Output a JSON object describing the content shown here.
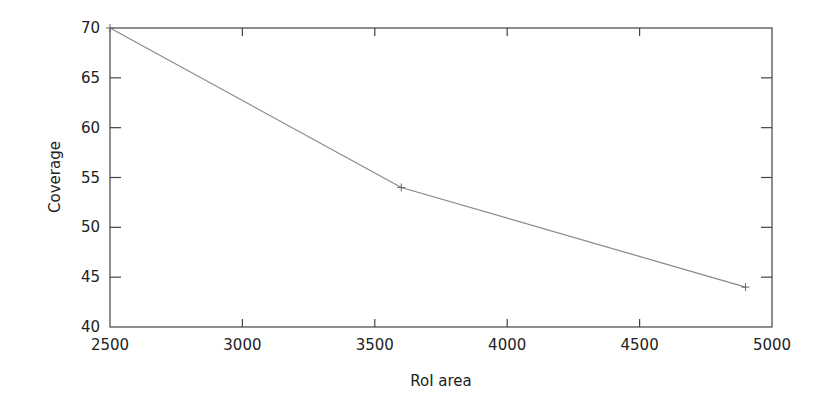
{
  "chart_data": {
    "type": "line",
    "title": "",
    "xlabel": "RoI area",
    "ylabel": "Coverage",
    "xlim": [
      2500,
      5000
    ],
    "ylim": [
      40,
      70
    ],
    "xticks": [
      2500,
      3000,
      3500,
      4000,
      4500,
      5000
    ],
    "yticks": [
      40,
      45,
      50,
      55,
      60,
      65,
      70
    ],
    "grid": false,
    "legend": null,
    "series": [
      {
        "name": "Coverage",
        "color": "#888888",
        "marker": "+",
        "x": [
          2500,
          3600,
          4900
        ],
        "y": [
          70,
          54,
          44
        ]
      }
    ]
  }
}
